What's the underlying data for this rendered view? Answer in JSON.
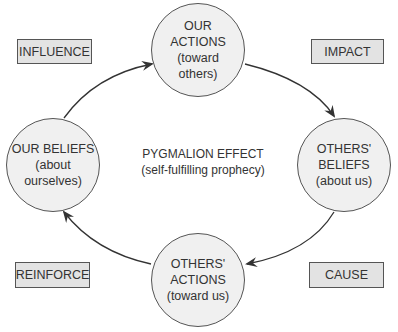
{
  "diagram": {
    "center": {
      "title": "PYGMALION EFFECT",
      "subtitle": "(self-fulfilling prophecy)"
    },
    "nodes": [
      {
        "id": "our-actions",
        "lines": [
          "OUR",
          "ACTIONS",
          "(toward",
          "others)"
        ]
      },
      {
        "id": "others-beliefs",
        "lines": [
          "OTHERS'",
          "BELIEFS",
          "(about us)"
        ]
      },
      {
        "id": "others-actions",
        "lines": [
          "OTHERS'",
          "ACTIONS",
          "(toward us)"
        ]
      },
      {
        "id": "our-beliefs",
        "lines": [
          "OUR BELIEFS",
          "(about",
          "ourselves)"
        ]
      }
    ],
    "labels": {
      "influence": "INFLUENCE",
      "impact": "IMPACT",
      "cause": "CAUSE",
      "reinforce": "REINFORCE"
    },
    "edges": [
      {
        "from": "our-beliefs",
        "to": "our-actions",
        "label": "INFLUENCE"
      },
      {
        "from": "our-actions",
        "to": "others-beliefs",
        "label": "IMPACT"
      },
      {
        "from": "others-beliefs",
        "to": "others-actions",
        "label": "CAUSE"
      },
      {
        "from": "others-actions",
        "to": "our-beliefs",
        "label": "REINFORCE"
      }
    ]
  }
}
